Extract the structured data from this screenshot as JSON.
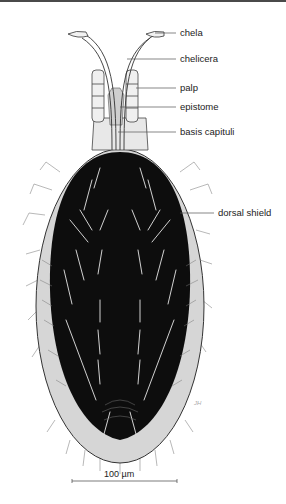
{
  "figure": {
    "labels": [
      {
        "text": "chela",
        "y": 33
      },
      {
        "text": "chelicera",
        "y": 59
      },
      {
        "text": "palp",
        "y": 88
      },
      {
        "text": "epistome",
        "y": 107
      },
      {
        "text": "basis capituli",
        "y": 132
      },
      {
        "text": "dorsal shield",
        "y": 213
      }
    ],
    "scale_bar": {
      "label": "100 µm"
    },
    "signature": "JH",
    "colors": {
      "shield": "#0d0d0d",
      "margin": "#d8d8d8",
      "outline": "#333333",
      "leader": "#555555"
    }
  }
}
